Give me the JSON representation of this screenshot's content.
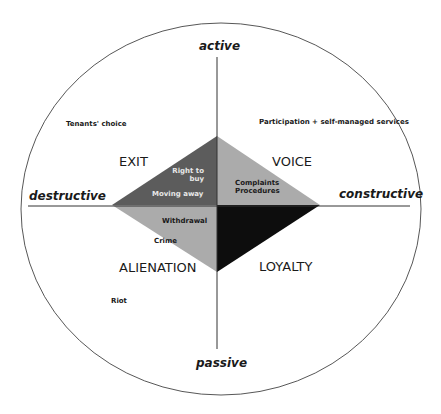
{
  "axes": {
    "top": "active",
    "bottom": "passive",
    "left": "destructive",
    "right": "constructive"
  },
  "quadrants": {
    "top_left": "EXIT",
    "top_right": "VOICE",
    "bottom_left": "ALIENATION",
    "bottom_right": "LOYALTY"
  },
  "outer_items": {
    "tenants_choice": "Tenants' choice",
    "participation": "Participation + self-managed services",
    "riot": "Riot"
  },
  "inner_items": {
    "right_to_buy_line1": "Right to",
    "right_to_buy_line2": "buy",
    "moving_away": "Moving away",
    "complaints_line1": "Complaints",
    "complaints_line2": "Procedures",
    "withdrawal": "Withdrawal",
    "crime": "Crime"
  },
  "colors": {
    "exit_fill": "#5c5c5c",
    "voice_fill": "#ababab",
    "alienation_fill": "#ababab",
    "loyalty_fill": "#0d0d0d",
    "lines": "#333333"
  }
}
